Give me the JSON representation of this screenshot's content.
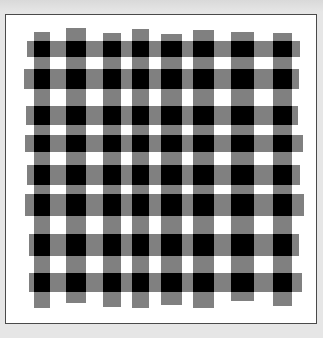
{
  "image": {
    "description": "Gingham / plaid checker pattern on white panel",
    "colors": {
      "background": "#e6e6e6",
      "panel": "#ffffff",
      "panel_border": "#4a4a4a",
      "stripe": "#808080",
      "intersection": "#000000"
    },
    "columns": [
      {
        "x1": 34,
        "x2": 50,
        "top": 32,
        "bottom": 308
      },
      {
        "x1": 66,
        "x2": 86,
        "top": 28,
        "bottom": 303
      },
      {
        "x1": 103,
        "x2": 121,
        "top": 33,
        "bottom": 307
      },
      {
        "x1": 132,
        "x2": 149,
        "top": 29,
        "bottom": 308
      },
      {
        "x1": 161,
        "x2": 182,
        "top": 34,
        "bottom": 305
      },
      {
        "x1": 193,
        "x2": 214,
        "top": 30,
        "bottom": 308
      },
      {
        "x1": 231,
        "x2": 254,
        "top": 32,
        "bottom": 301
      },
      {
        "x1": 273,
        "x2": 292,
        "top": 33,
        "bottom": 306
      }
    ],
    "rows": [
      {
        "y1": 41,
        "y2": 57,
        "left": 27,
        "right": 300
      },
      {
        "y1": 69,
        "y2": 89,
        "left": 24,
        "right": 299
      },
      {
        "y1": 106,
        "y2": 125,
        "left": 26,
        "right": 298
      },
      {
        "y1": 135,
        "y2": 152,
        "left": 25,
        "right": 303
      },
      {
        "y1": 165,
        "y2": 185,
        "left": 27,
        "right": 300
      },
      {
        "y1": 194,
        "y2": 216,
        "left": 25,
        "right": 304
      },
      {
        "y1": 234,
        "y2": 256,
        "left": 29,
        "right": 299
      },
      {
        "y1": 273,
        "y2": 292,
        "left": 29,
        "right": 302
      }
    ]
  }
}
